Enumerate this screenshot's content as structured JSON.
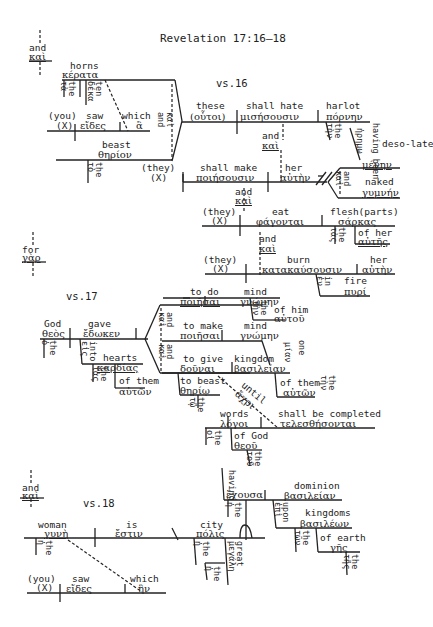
{
  "title": "Revelation 17:16–18",
  "verses": {
    "v16": "vs.16",
    "v17": "vs.17",
    "v18": "vs.18"
  },
  "connectors": {
    "and1": {
      "en": "and",
      "gr": "καὶ"
    },
    "for": {
      "en": "for",
      "gr": "γὰρ"
    },
    "and2": {
      "en": "and",
      "gr": "καὶ"
    }
  },
  "v16": {
    "horns": {
      "en": "horns",
      "gr": "κέρατα"
    },
    "the_ta": {
      "en": "the",
      "gr": "τὰ"
    },
    "ten": {
      "en": "ten",
      "gr": "δέκα"
    },
    "you": {
      "en": "(you)",
      "gr": "(X)"
    },
    "saw": {
      "en": "saw",
      "gr": "εἴδες"
    },
    "which": {
      "en": "which",
      "gr": "ἃ"
    },
    "and_kai": {
      "en": "and",
      "gr": "καὶ"
    },
    "beast": {
      "en": "beast",
      "gr": "θηρίον"
    },
    "the_to": {
      "en": "the",
      "gr": "τὸ"
    },
    "these": {
      "en": "these",
      "gr": "(οὗτοι)"
    },
    "shall_hate": {
      "en": "shall hate",
      "gr": "μισήσουσιν"
    },
    "harlot": {
      "en": "harlot",
      "gr": "πόρνην"
    },
    "the_ten": {
      "en": "the",
      "gr": "τὴν"
    },
    "having_been": {
      "en": "having been",
      "gr": "ἠρημω"
    },
    "desolate": {
      "en": "deso-late",
      "gr": "μένην"
    },
    "and_a": {
      "en": "and",
      "gr": "καὶ"
    },
    "they1": {
      "en": "(they)",
      "gr": "(X)"
    },
    "shall_make": {
      "en": "shall make",
      "gr": "ποιήσουσιν"
    },
    "her1": {
      "en": "her",
      "gr": "αὐτὴν"
    },
    "and_b": {
      "en": "and",
      "gr": "καὶ"
    },
    "naked": {
      "en": "naked",
      "gr": "γυμνήν"
    },
    "and_c": {
      "en": "and",
      "gr": "καὶ"
    },
    "they2": {
      "en": "(they)",
      "gr": "(X)"
    },
    "eat": {
      "en": "eat",
      "gr": "φάγονται"
    },
    "flesh": {
      "en": "flesh(parts)",
      "gr": "σάρκας"
    },
    "the_tas": {
      "en": "the",
      "gr": "τὰς"
    },
    "of_her": {
      "en": "of her",
      "gr": "αὐτῆς"
    },
    "and_d": {
      "en": "and",
      "gr": "καὶ"
    },
    "they3": {
      "en": "(they)",
      "gr": "(X)"
    },
    "burn": {
      "en": "burn",
      "gr": "κατακαύσουσιν"
    },
    "her2": {
      "en": "her",
      "gr": "αὐτὴν"
    },
    "in": {
      "en": "in",
      "gr": "ἐν"
    },
    "fire": {
      "en": "fire",
      "gr": "πυρί"
    }
  },
  "v17": {
    "god": {
      "en": "God",
      "gr": "θεὸς"
    },
    "the_o": {
      "en": "the",
      "gr": "ὁ"
    },
    "gave": {
      "en": "gave",
      "gr": "ἔδωκεν"
    },
    "into": {
      "en": "into",
      "gr": "εἰς"
    },
    "hearts": {
      "en": "hearts",
      "gr": "καρδίας"
    },
    "the_tas": {
      "en": "the",
      "gr": "τὰς"
    },
    "of_them1": {
      "en": "of them",
      "gr": "αὐτῶν"
    },
    "to_do": {
      "en": "to do",
      "gr": "ποιῆσαι"
    },
    "mind1": {
      "en": "mind",
      "gr": "γνώμην"
    },
    "the_ten1": {
      "en": "the",
      "gr": "τὴν"
    },
    "of_him": {
      "en": "of him",
      "gr": "αὐτοῦ"
    },
    "and1": {
      "en": "and",
      "gr": "καὶ"
    },
    "to_make": {
      "en": "to make",
      "gr": "ποιῆσαι"
    },
    "mind2": {
      "en": "mind",
      "gr": "γνώμην"
    },
    "one": {
      "en": "one",
      "gr": "μίαν"
    },
    "and2": {
      "en": "and",
      "gr": "καὶ"
    },
    "to_give": {
      "en": "to give",
      "gr": "δοῦναι"
    },
    "kingdom": {
      "en": "kingdom",
      "gr": "βασιλείαν"
    },
    "the_ten2": {
      "en": "the",
      "gr": "τὴν"
    },
    "of_them2": {
      "en": "of them",
      "gr": "αὐτῶν"
    },
    "to_beast": {
      "en": "to beast",
      "gr": "θηρίῳ"
    },
    "the_to": {
      "en": "the",
      "gr": "τῷ"
    },
    "until": {
      "en": "until",
      "gr": "ἄχρι"
    },
    "words": {
      "en": "words",
      "gr": "λόγοι"
    },
    "the_oi": {
      "en": "the",
      "gr": "οἱ"
    },
    "shall_be_completed": {
      "en": "shall be completed",
      "gr": "τελεσθήσονται"
    },
    "of_god": {
      "en": "of God",
      "gr": "θεοῦ"
    },
    "the_tou": {
      "en": "the",
      "gr": "τοῦ"
    }
  },
  "v18": {
    "woman": {
      "en": "woman",
      "gr": "γυνὴ"
    },
    "the_e": {
      "en": "the",
      "gr": "ἡ"
    },
    "is": {
      "en": "is",
      "gr": "ἔστιν"
    },
    "city": {
      "en": "city",
      "gr": "πόλις"
    },
    "the_e2": {
      "en": "the",
      "gr": "ἡ"
    },
    "great": {
      "en": "great",
      "gr": "μεγάλη"
    },
    "the_e3": {
      "en": "the",
      "gr": "ἡ"
    },
    "having": {
      "en": "having",
      "gr": "ἔχουσα"
    },
    "the_e4": {
      "en": "the",
      "gr": "ἡ"
    },
    "dominion": {
      "en": "dominion",
      "gr": "βασιλείαν"
    },
    "upon": {
      "en": "upon",
      "gr": "ἐπὶ"
    },
    "kingdoms": {
      "en": "kingdoms",
      "gr": "βασιλέων"
    },
    "the_ton": {
      "en": "the",
      "gr": "τῶν"
    },
    "of_earth": {
      "en": "of earth",
      "gr": "γῆς"
    },
    "the_tes": {
      "en": "the",
      "gr": "τῆς"
    },
    "you": {
      "en": "(you)",
      "gr": "(X)"
    },
    "saw": {
      "en": "saw",
      "gr": "εἴδες"
    },
    "which": {
      "en": "which",
      "gr": "ἣν"
    }
  }
}
